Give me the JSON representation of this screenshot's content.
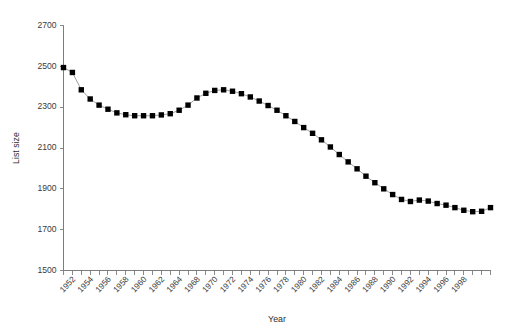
{
  "chart_data": {
    "type": "line",
    "title": "",
    "xlabel": "Year",
    "ylabel": "List size",
    "ylim": [
      1500,
      2700
    ],
    "xlim": [
      1950,
      1998
    ],
    "ytick_step": 200,
    "yticks": [
      1500,
      1700,
      1900,
      2100,
      2300,
      2500,
      2700
    ],
    "xticks": [
      1950,
      1951,
      1952,
      1953,
      1954,
      1955,
      1956,
      1957,
      1958,
      1959,
      1960,
      1961,
      1962,
      1963,
      1964,
      1965,
      1966,
      1967,
      1968,
      1969,
      1970,
      1971,
      1972,
      1973,
      1974,
      1975,
      1976,
      1977,
      1978,
      1979,
      1980,
      1981,
      1982,
      1983,
      1984,
      1985,
      1986,
      1987,
      1988,
      1989,
      1990,
      1991,
      1992,
      1993,
      1994,
      1995,
      1996,
      1997,
      1998
    ],
    "xtick_labels": [
      "",
      "1952",
      "",
      "1954",
      "",
      "1956",
      "",
      "1958",
      "",
      "1960",
      "",
      "1962",
      "",
      "1964",
      "",
      "1968",
      "",
      "1970",
      "",
      "1972",
      "",
      "1974",
      "",
      "1976",
      "",
      "1978",
      "",
      "1980",
      "",
      "1982",
      "",
      "1984",
      "",
      "1986",
      "",
      "1988",
      "",
      "1990",
      "",
      "1992",
      "",
      "1994",
      "",
      "1996",
      "",
      "1998"
    ],
    "xtick_labels_shown": [
      "1952",
      "1954",
      "1956",
      "1958",
      "1960",
      "1962",
      "1964",
      "1968",
      "1970",
      "1972",
      "1974",
      "1976",
      "1978",
      "1980",
      "1982",
      "1984",
      "1986",
      "1988",
      "1990",
      "1992",
      "1994",
      "1996",
      "1998"
    ],
    "grid": false,
    "legend": false,
    "marker": "filled-square",
    "marker_color": "#000000",
    "line_color": "#8a8a8a",
    "x": [
      1950,
      1951,
      1952,
      1953,
      1954,
      1955,
      1956,
      1957,
      1958,
      1959,
      1960,
      1961,
      1962,
      1963,
      1964,
      1965,
      1966,
      1967,
      1968,
      1969,
      1970,
      1971,
      1972,
      1973,
      1974,
      1975,
      1976,
      1977,
      1978,
      1979,
      1980,
      1981,
      1982,
      1983,
      1984,
      1985,
      1986,
      1987,
      1988,
      1989,
      1990,
      1991,
      1992,
      1993,
      1994,
      1995,
      1996,
      1997,
      1998
    ],
    "values": [
      2494,
      2470,
      2385,
      2340,
      2310,
      2290,
      2272,
      2263,
      2258,
      2258,
      2258,
      2262,
      2268,
      2285,
      2310,
      2345,
      2368,
      2382,
      2385,
      2378,
      2366,
      2350,
      2330,
      2308,
      2285,
      2258,
      2230,
      2200,
      2172,
      2140,
      2105,
      2068,
      2032,
      1998,
      1962,
      1930,
      1900,
      1872,
      1848,
      1838,
      1845,
      1840,
      1828,
      1820,
      1808,
      1795,
      1788,
      1790,
      1808
    ],
    "series": [
      {
        "name": "List size",
        "values": [
          2494,
          2470,
          2385,
          2340,
          2310,
          2290,
          2272,
          2263,
          2258,
          2258,
          2258,
          2262,
          2268,
          2285,
          2310,
          2345,
          2368,
          2382,
          2385,
          2378,
          2366,
          2350,
          2330,
          2308,
          2285,
          2258,
          2230,
          2200,
          2172,
          2140,
          2105,
          2068,
          2032,
          1998,
          1962,
          1930,
          1900,
          1872,
          1848,
          1838,
          1845,
          1840,
          1828,
          1820,
          1808,
          1795,
          1788,
          1790,
          1808
        ]
      }
    ],
    "annotations": []
  }
}
